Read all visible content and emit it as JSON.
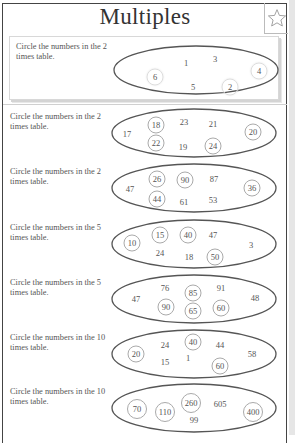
{
  "title": "Multiples",
  "star_icon": "star-outline-icon",
  "example": {
    "prompt": "Circle the numbers in the 2 times table.",
    "numbers": [
      {
        "value": "1",
        "x": 73,
        "y": 19,
        "circled": false
      },
      {
        "value": "3",
        "x": 102,
        "y": 15,
        "circled": false
      },
      {
        "value": "6",
        "x": 42,
        "y": 33,
        "circled": true
      },
      {
        "value": "4",
        "x": 146,
        "y": 27,
        "circled": true
      },
      {
        "value": "5",
        "x": 80,
        "y": 43,
        "circled": false
      },
      {
        "value": "2",
        "x": 117,
        "y": 43,
        "circled": true
      }
    ]
  },
  "questions": [
    {
      "prompt": "Circle the numbers in the 2 times table.",
      "numbers": [
        {
          "value": "17",
          "x": 17,
          "y": 27,
          "circled": false
        },
        {
          "value": "18",
          "x": 46,
          "y": 18,
          "circled": true
        },
        {
          "value": "23",
          "x": 74,
          "y": 15,
          "circled": false
        },
        {
          "value": "21",
          "x": 103,
          "y": 17,
          "circled": false
        },
        {
          "value": "20",
          "x": 143,
          "y": 25,
          "circled": true
        },
        {
          "value": "22",
          "x": 46,
          "y": 36,
          "circled": true
        },
        {
          "value": "19",
          "x": 73,
          "y": 40,
          "circled": false
        },
        {
          "value": "24",
          "x": 103,
          "y": 39,
          "circled": true
        }
      ]
    },
    {
      "prompt": "Circle the numbers in the 2 times table.",
      "numbers": [
        {
          "value": "47",
          "x": 20,
          "y": 27,
          "circled": false
        },
        {
          "value": "26",
          "x": 47,
          "y": 17,
          "circled": true
        },
        {
          "value": "90",
          "x": 75,
          "y": 18,
          "circled": true
        },
        {
          "value": "87",
          "x": 104,
          "y": 17,
          "circled": false
        },
        {
          "value": "36",
          "x": 142,
          "y": 26,
          "circled": true
        },
        {
          "value": "44",
          "x": 47,
          "y": 37,
          "circled": true
        },
        {
          "value": "61",
          "x": 74,
          "y": 40,
          "circled": false
        },
        {
          "value": "53",
          "x": 103,
          "y": 38,
          "circled": false
        }
      ]
    },
    {
      "prompt": "Circle the numbers in the 5 times table.",
      "numbers": [
        {
          "value": "10",
          "x": 22,
          "y": 25,
          "circled": true
        },
        {
          "value": "15",
          "x": 50,
          "y": 17,
          "circled": true
        },
        {
          "value": "40",
          "x": 78,
          "y": 17,
          "circled": true
        },
        {
          "value": "47",
          "x": 103,
          "y": 17,
          "circled": false
        },
        {
          "value": "3",
          "x": 141,
          "y": 27,
          "circled": false
        },
        {
          "value": "24",
          "x": 50,
          "y": 35,
          "circled": false
        },
        {
          "value": "18",
          "x": 79,
          "y": 39,
          "circled": false
        },
        {
          "value": "50",
          "x": 105,
          "y": 39,
          "circled": true
        }
      ]
    },
    {
      "prompt": "Circle the numbers in the 5 times table.",
      "numbers": [
        {
          "value": "47",
          "x": 26,
          "y": 26,
          "circled": false
        },
        {
          "value": "76",
          "x": 55,
          "y": 15,
          "circled": false
        },
        {
          "value": "85",
          "x": 83,
          "y": 20,
          "circled": true
        },
        {
          "value": "91",
          "x": 111,
          "y": 15,
          "circled": false
        },
        {
          "value": "48",
          "x": 145,
          "y": 25,
          "circled": false
        },
        {
          "value": "90",
          "x": 56,
          "y": 34,
          "circled": true
        },
        {
          "value": "65",
          "x": 83,
          "y": 38,
          "circled": true
        },
        {
          "value": "60",
          "x": 111,
          "y": 35,
          "circled": true
        }
      ]
    },
    {
      "prompt": "Circle the numbers in the 10 times table.",
      "numbers": [
        {
          "value": "20",
          "x": 26,
          "y": 26,
          "circled": true
        },
        {
          "value": "24",
          "x": 55,
          "y": 17,
          "circled": false
        },
        {
          "value": "40",
          "x": 83,
          "y": 14,
          "circled": true
        },
        {
          "value": "44",
          "x": 110,
          "y": 17,
          "circled": false
        },
        {
          "value": "58",
          "x": 142,
          "y": 26,
          "circled": false
        },
        {
          "value": "15",
          "x": 55,
          "y": 34,
          "circled": false
        },
        {
          "value": "1",
          "x": 78,
          "y": 30,
          "circled": false
        },
        {
          "value": "60",
          "x": 110,
          "y": 38,
          "circled": true
        }
      ]
    },
    {
      "prompt": "Circle the numbers in the 10 times table.",
      "numbers": [
        {
          "value": "70",
          "x": 27,
          "y": 27,
          "circled": true,
          "wide": true
        },
        {
          "value": "110",
          "x": 55,
          "y": 30,
          "circled": true,
          "wide": true
        },
        {
          "value": "260",
          "x": 81,
          "y": 21,
          "circled": true,
          "wide": true
        },
        {
          "value": "605",
          "x": 110,
          "y": 22,
          "circled": false
        },
        {
          "value": "400",
          "x": 143,
          "y": 30,
          "circled": true,
          "wide": true
        },
        {
          "value": "99",
          "x": 84,
          "y": 38,
          "circled": false
        }
      ]
    }
  ]
}
